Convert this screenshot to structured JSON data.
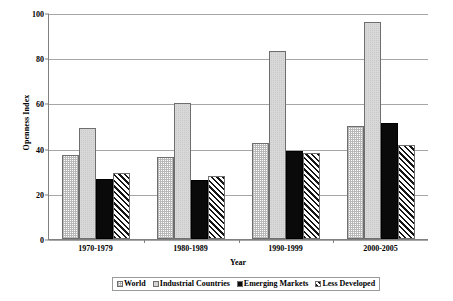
{
  "chart_data": {
    "type": "bar",
    "title": "",
    "xlabel": "Year",
    "ylabel": "Openness Index",
    "categories": [
      "1970-1979",
      "1980-1989",
      "1990-1999",
      "2000-2005"
    ],
    "series": [
      {
        "name": "World",
        "values": [
          37,
          36.5,
          42.5,
          50
        ]
      },
      {
        "name": "Industrial Countries",
        "values": [
          49,
          60,
          83,
          96
        ]
      },
      {
        "name": "Emerging Markets",
        "values": [
          26.5,
          26,
          39,
          51.5
        ]
      },
      {
        "name": "Less Developed",
        "values": [
          29,
          28,
          38,
          41.5
        ]
      }
    ],
    "ylim": [
      0,
      100
    ],
    "yticks": [
      0,
      20,
      40,
      60,
      80,
      100
    ],
    "ytick_labels": [
      "0",
      "20",
      "40",
      "60",
      "80",
      "100"
    ],
    "grid": true,
    "legend_position": "bottom"
  },
  "legend": {
    "items": [
      {
        "label": "World",
        "swatch": "checker-light-swatch"
      },
      {
        "label": "Industrial Countries",
        "swatch": "checker-gray-swatch"
      },
      {
        "label": "Emerging Markets",
        "swatch": "solid-black-swatch"
      },
      {
        "label": "Less Developed",
        "swatch": "diagonal-hatch-swatch"
      }
    ]
  }
}
